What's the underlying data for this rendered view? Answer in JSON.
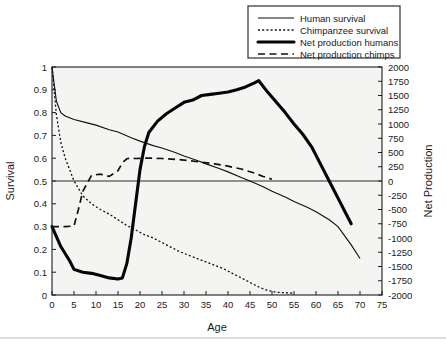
{
  "chart_data": {
    "type": "line",
    "title": "",
    "xlabel": "Age",
    "ylabel": "Survival",
    "y2label": "Net Production",
    "xlim": [
      0,
      75
    ],
    "ylim": [
      0,
      1
    ],
    "y2lim": [
      -2000,
      2000
    ],
    "grid": false,
    "legend_position": "top-right",
    "xticks": [
      "0",
      "5",
      "10",
      "15",
      "20",
      "25",
      "30",
      "35",
      "40",
      "45",
      "50",
      "55",
      "60",
      "65",
      "70",
      "75"
    ],
    "yticks": [
      "0",
      "0.1",
      "0.2",
      "0.3",
      "0.4",
      "0.5",
      "0.6",
      "0.7",
      "0.8",
      "0.9",
      "1"
    ],
    "y2ticks": [
      "2000",
      "1750",
      "1500",
      "1250",
      "1000",
      "750",
      "500",
      "250",
      "0",
      "-250",
      "-500",
      "-750",
      "-1000",
      "-1250",
      "-1500",
      "-1750",
      "-2000"
    ],
    "series": [
      {
        "name": "Human survival",
        "axis": "left",
        "style": "solid-thin",
        "x": [
          0,
          1,
          2,
          3,
          5,
          8,
          10,
          13,
          15,
          18,
          20,
          23,
          25,
          28,
          30,
          33,
          35,
          38,
          40,
          43,
          45,
          48,
          50,
          53,
          55,
          58,
          60,
          63,
          65,
          68,
          70
        ],
        "y": [
          1.0,
          0.85,
          0.8,
          0.785,
          0.77,
          0.755,
          0.745,
          0.725,
          0.715,
          0.69,
          0.675,
          0.655,
          0.645,
          0.625,
          0.61,
          0.59,
          0.575,
          0.555,
          0.54,
          0.515,
          0.5,
          0.475,
          0.455,
          0.43,
          0.41,
          0.385,
          0.365,
          0.33,
          0.3,
          0.22,
          0.16
        ]
      },
      {
        "name": "Chimpanzee survival",
        "axis": "left",
        "style": "dotted",
        "x": [
          0,
          1,
          2,
          3,
          5,
          7,
          9,
          11,
          13,
          15,
          17,
          19,
          21,
          23,
          25,
          27,
          29,
          31,
          33,
          35,
          37,
          39,
          41,
          43,
          45,
          47,
          49,
          51,
          55
        ],
        "y": [
          1.0,
          0.79,
          0.67,
          0.6,
          0.5,
          0.435,
          0.4,
          0.375,
          0.355,
          0.33,
          0.305,
          0.285,
          0.265,
          0.25,
          0.23,
          0.21,
          0.19,
          0.175,
          0.16,
          0.145,
          0.13,
          0.115,
          0.095,
          0.075,
          0.055,
          0.035,
          0.02,
          0.012,
          0.008
        ]
      },
      {
        "name": "Net production humans",
        "axis": "right",
        "style": "solid-thick",
        "x": [
          0,
          2,
          4,
          5,
          7,
          9,
          11,
          13,
          15,
          16,
          17,
          18,
          19,
          20,
          21,
          22,
          24,
          26,
          28,
          30,
          32,
          34,
          36,
          38,
          40,
          42,
          44,
          46,
          47,
          49,
          51,
          53,
          55,
          57,
          59,
          61,
          63,
          65,
          67,
          68
        ],
        "y": [
          -800,
          -1150,
          -1400,
          -1550,
          -1600,
          -1620,
          -1660,
          -1700,
          -1720,
          -1700,
          -1450,
          -1000,
          -400,
          200,
          600,
          850,
          1050,
          1180,
          1280,
          1380,
          1420,
          1500,
          1520,
          1540,
          1560,
          1600,
          1650,
          1720,
          1760,
          1560,
          1380,
          1200,
          1000,
          820,
          600,
          300,
          0,
          -300,
          -600,
          -750
        ]
      },
      {
        "name": "Net production chimps",
        "axis": "right",
        "style": "dashed",
        "x": [
          0,
          3,
          5,
          6,
          7,
          9,
          11,
          13,
          15,
          16,
          17,
          18,
          19,
          21,
          23,
          25,
          28,
          31,
          34,
          37,
          40,
          43,
          46,
          48,
          50
        ],
        "y": [
          -800,
          -800,
          -790,
          -500,
          -180,
          100,
          120,
          80,
          180,
          320,
          390,
          400,
          395,
          400,
          400,
          395,
          380,
          360,
          330,
          300,
          260,
          210,
          140,
          80,
          30
        ]
      }
    ]
  },
  "legend": {
    "items": [
      {
        "label": "Human survival"
      },
      {
        "label": "Chimpanzee survival"
      },
      {
        "label": "Net production humans"
      },
      {
        "label": "Net production chimps"
      }
    ]
  }
}
